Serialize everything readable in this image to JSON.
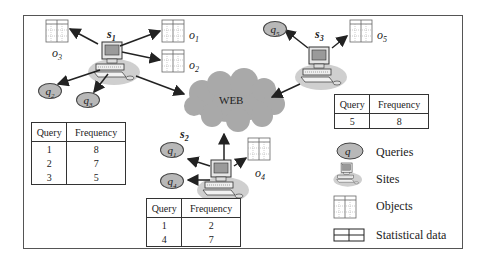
{
  "web_label": "WEB",
  "sites": [
    {
      "id": "s1",
      "label": "s",
      "sub": "1"
    },
    {
      "id": "s2",
      "label": "s",
      "sub": "2"
    },
    {
      "id": "s3",
      "label": "s",
      "sub": "3"
    }
  ],
  "objects": [
    {
      "label": "o",
      "sub": "1"
    },
    {
      "label": "o",
      "sub": "2"
    },
    {
      "label": "o",
      "sub": "3"
    },
    {
      "label": "o",
      "sub": "4"
    },
    {
      "label": "o",
      "sub": "5"
    }
  ],
  "queries": [
    {
      "label": "q",
      "sub": "1"
    },
    {
      "label": "q",
      "sub": "2"
    },
    {
      "label": "q",
      "sub": "3"
    },
    {
      "label": "q",
      "sub": "4"
    },
    {
      "label": "q",
      "sub": "5"
    }
  ],
  "tables": {
    "s1": {
      "headers": [
        "Query",
        "Frequency"
      ],
      "rows": [
        [
          "1",
          "8"
        ],
        [
          "2",
          "7"
        ],
        [
          "3",
          "5"
        ]
      ]
    },
    "s2": {
      "headers": [
        "Query",
        "Frequency"
      ],
      "rows": [
        [
          "1",
          "2"
        ],
        [
          "4",
          "7"
        ]
      ]
    },
    "s3": {
      "headers": [
        "Query",
        "Frequency"
      ],
      "rows": [
        [
          "5",
          "8"
        ]
      ]
    }
  },
  "legend": {
    "query_symbol": "q",
    "items": [
      "Queries",
      "Sites",
      "Objects",
      "Statistical data"
    ]
  },
  "colors": {
    "cloud": "#a9a9a9",
    "query_fill": "#b8b8b8",
    "site_shadow": "#cfcfcf",
    "line": "#222222"
  }
}
